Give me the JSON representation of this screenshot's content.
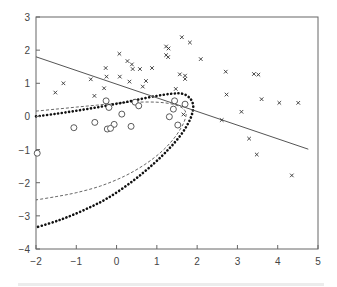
{
  "chart_data": {
    "type": "scatter",
    "title": "",
    "xlabel": "",
    "ylabel": "",
    "xlim": [
      -2,
      5
    ],
    "ylim": [
      -4,
      3
    ],
    "xticks": [
      -2,
      -1,
      0,
      1,
      2,
      3,
      4,
      5
    ],
    "yticks": [
      -4,
      -3,
      -2,
      -1,
      0,
      1,
      2,
      3
    ],
    "xtick_labels": [
      "−2",
      "−1",
      "0",
      "1",
      "2",
      "3",
      "4",
      "5"
    ],
    "ytick_labels": [
      "−4",
      "−3",
      "−2",
      "−1",
      "0",
      "1",
      "2",
      "3"
    ],
    "grid": false,
    "legend": null,
    "series": [
      {
        "name": "class-cross",
        "marker": "x",
        "color": "#333333",
        "points": [
          [
            0.07,
            1.89
          ],
          [
            -0.27,
            1.46
          ],
          [
            0.08,
            1.2
          ],
          [
            -0.25,
            1.2
          ],
          [
            -1.32,
            1.0
          ],
          [
            -0.64,
            1.12
          ],
          [
            -1.52,
            0.72
          ],
          [
            -0.31,
            0.85
          ],
          [
            -0.55,
            0.62
          ],
          [
            0.32,
            1.05
          ],
          [
            1.62,
            2.39
          ],
          [
            1.82,
            2.23
          ],
          [
            1.23,
            2.11
          ],
          [
            1.29,
            2.05
          ],
          [
            1.23,
            1.85
          ],
          [
            1.28,
            1.79
          ],
          [
            0.27,
            1.67
          ],
          [
            0.38,
            1.57
          ],
          [
            0.4,
            1.43
          ],
          [
            0.58,
            1.43
          ],
          [
            0.88,
            1.46
          ],
          [
            0.73,
            1.07
          ],
          [
            0.65,
            0.9
          ],
          [
            1.47,
            0.83
          ],
          [
            1.57,
            1.27
          ],
          [
            1.7,
            1.23
          ],
          [
            1.7,
            1.13
          ],
          [
            2.09,
            1.73
          ],
          [
            2.71,
            1.35
          ],
          [
            3.41,
            1.28
          ],
          [
            3.52,
            1.26
          ],
          [
            2.73,
            0.66
          ],
          [
            3.6,
            0.52
          ],
          [
            4.04,
            0.41
          ],
          [
            4.51,
            0.41
          ],
          [
            3.1,
            0.14
          ],
          [
            2.61,
            -0.11
          ],
          [
            3.29,
            -0.67
          ],
          [
            3.48,
            -1.15
          ],
          [
            4.35,
            -1.78
          ],
          [
            1.66,
            0.06
          ]
        ]
      },
      {
        "name": "class-circle",
        "marker": "o",
        "color": "#333333",
        "points": [
          [
            -1.97,
            -1.11
          ],
          [
            -0.26,
            0.47
          ],
          [
            -0.19,
            0.27
          ],
          [
            0.46,
            0.43
          ],
          [
            0.55,
            0.32
          ],
          [
            0.13,
            0.07
          ],
          [
            -1.06,
            -0.34
          ],
          [
            -0.54,
            -0.18
          ],
          [
            -0.06,
            -0.24
          ],
          [
            -0.23,
            -0.38
          ],
          [
            -0.15,
            -0.36
          ],
          [
            0.36,
            -0.3
          ],
          [
            1.44,
            0.47
          ],
          [
            1.7,
            0.37
          ],
          [
            1.41,
            0.22
          ],
          [
            1.31,
            -0.01
          ],
          [
            1.52,
            -0.26
          ]
        ]
      }
    ],
    "lines": [
      {
        "name": "linear-boundary",
        "style": "solid",
        "color": "#555555",
        "points": [
          [
            -2,
            1.8
          ],
          [
            4.76,
            -0.99
          ]
        ]
      },
      {
        "name": "quadratic-boundary-dotted",
        "style": "dotted-heavy",
        "color": "#111111",
        "points": [
          [
            -2,
            0.0
          ],
          [
            -1.5,
            0.08
          ],
          [
            -1.0,
            0.17
          ],
          [
            -0.5,
            0.27
          ],
          [
            0.0,
            0.38
          ],
          [
            0.5,
            0.5
          ],
          [
            1.0,
            0.62
          ],
          [
            1.4,
            0.69
          ],
          [
            1.65,
            0.68
          ],
          [
            1.82,
            0.55
          ],
          [
            1.9,
            0.35
          ],
          [
            1.88,
            0.1
          ],
          [
            1.78,
            -0.2
          ],
          [
            1.6,
            -0.55
          ],
          [
            1.3,
            -0.98
          ],
          [
            0.9,
            -1.45
          ],
          [
            0.4,
            -1.95
          ],
          [
            -0.2,
            -2.45
          ],
          [
            -0.8,
            -2.82
          ],
          [
            -1.4,
            -3.12
          ],
          [
            -2,
            -3.35
          ]
        ]
      },
      {
        "name": "quadratic-boundary-dashed",
        "style": "dashed",
        "color": "#555555",
        "points": [
          [
            -2,
            0.16
          ],
          [
            -1.5,
            0.22
          ],
          [
            -1.0,
            0.28
          ],
          [
            -0.5,
            0.34
          ],
          [
            0.0,
            0.4
          ],
          [
            0.5,
            0.43
          ],
          [
            1.0,
            0.43
          ],
          [
            1.35,
            0.38
          ],
          [
            1.6,
            0.28
          ],
          [
            1.72,
            0.12
          ],
          [
            1.7,
            -0.08
          ],
          [
            1.6,
            -0.35
          ],
          [
            1.4,
            -0.7
          ],
          [
            1.1,
            -1.08
          ],
          [
            0.7,
            -1.45
          ],
          [
            0.2,
            -1.8
          ],
          [
            -0.4,
            -2.1
          ],
          [
            -1.0,
            -2.3
          ],
          [
            -1.5,
            -2.42
          ],
          [
            -2,
            -2.52
          ]
        ]
      }
    ],
    "layout": {
      "plot_left": 36,
      "plot_right": 318,
      "plot_top": 17,
      "plot_bottom": 249
    }
  }
}
